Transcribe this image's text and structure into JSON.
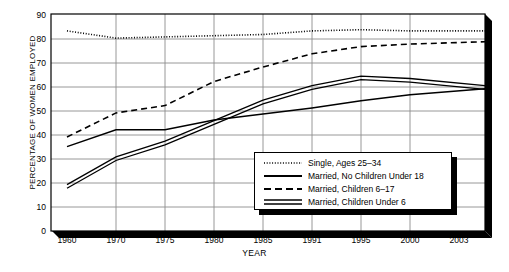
{
  "chart_data": {
    "type": "line",
    "title": "",
    "xlabel": "YEAR",
    "ylabel": "PERCENTAGE OF WOMEN EMPLOYED",
    "categories": [
      "1960",
      "1970",
      "1975",
      "1980",
      "1985",
      "1991",
      "1995",
      "2000",
      "2003"
    ],
    "ylim": [
      0,
      90
    ],
    "yticks": [
      0,
      10,
      20,
      30,
      40,
      50,
      60,
      70,
      80,
      90
    ],
    "grid": true,
    "legend_position": "inside-bottom-right",
    "series": [
      {
        "name": "Single, Ages 25–34",
        "style": "dotted",
        "values": [
          83,
          80,
          80.5,
          81,
          81.5,
          83,
          83.5,
          83,
          83
        ]
      },
      {
        "name": "Married, No Children Under 18",
        "style": "solid",
        "values": [
          35,
          42,
          42,
          46,
          48.5,
          51,
          54,
          56.5,
          59
        ]
      },
      {
        "name": "Married, Children 6–17",
        "style": "dashed",
        "values": [
          39,
          49,
          52,
          62,
          68,
          73.5,
          76.5,
          77.5,
          78.5
        ]
      },
      {
        "name": "Married, Children Under 6",
        "style": "double",
        "values": [
          18.5,
          30,
          36.5,
          45,
          53.5,
          59.5,
          63.5,
          62.5,
          59.5
        ]
      }
    ]
  },
  "axes": {
    "y_tick_labels": [
      "90",
      "80",
      "70",
      "60",
      "50",
      "40",
      "30",
      "20",
      "10",
      "0"
    ],
    "x_tick_labels": [
      "1960",
      "1970",
      "1975",
      "1980",
      "1985",
      "1991",
      "1995",
      "2000",
      "2003"
    ],
    "y_axis_title": "PERCENTAGE OF WOMEN EMPLOYED",
    "x_axis_title": "YEAR"
  },
  "legend": {
    "entries": [
      {
        "label": "Single, Ages 25–34",
        "style": "dotted"
      },
      {
        "label": "Married, No Children Under 18",
        "style": "solid"
      },
      {
        "label": "Married, Children 6–17",
        "style": "dashed"
      },
      {
        "label": "Married, Children Under 6",
        "style": "double"
      }
    ]
  },
  "colors": {
    "line": "#000000",
    "grid": "#8c8c8c",
    "frame": "#000000",
    "shadow": "#000000",
    "background": "#ffffff"
  }
}
